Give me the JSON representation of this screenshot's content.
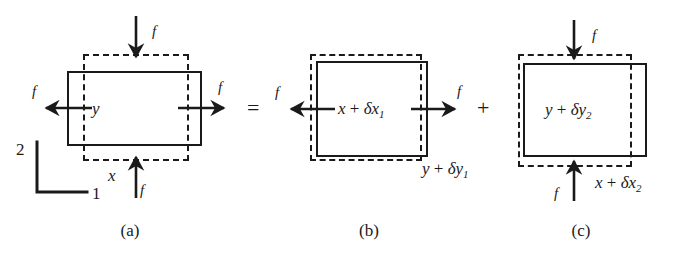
{
  "figure": {
    "type": "mechanics-decomposition-diagram",
    "ink_color": "#1a1a1a",
    "background": "#ffffff",
    "operators": {
      "equals": "=",
      "plus": "+"
    },
    "axis_indicator": {
      "vertical_label": "2",
      "horizontal_label": "1"
    },
    "panels": [
      {
        "id": "a",
        "caption": "(a)",
        "inner_labels": [
          {
            "name": "width-label",
            "text": "x"
          },
          {
            "name": "height-label",
            "text": "y"
          }
        ],
        "forces": [
          {
            "name": "force-top",
            "label": "f",
            "direction": "down"
          },
          {
            "name": "force-bottom",
            "label": "f",
            "direction": "up"
          },
          {
            "name": "force-left",
            "label": "f",
            "direction": "left"
          },
          {
            "name": "force-right",
            "label": "f",
            "direction": "right"
          }
        ],
        "shapes": [
          {
            "name": "solid-rectangle",
            "style": "solid"
          },
          {
            "name": "dashed-rectangle",
            "style": "dashed"
          }
        ]
      },
      {
        "id": "b",
        "caption": "(b)",
        "center_expr": {
          "base": "x",
          "op": "+",
          "delta": "δx",
          "sub": "1"
        },
        "bottom_expr": {
          "base": "y",
          "op": "+",
          "delta": "δy",
          "sub": "1"
        },
        "forces": [
          {
            "name": "force-left",
            "label": "f",
            "direction": "left"
          },
          {
            "name": "force-right",
            "label": "f",
            "direction": "right"
          }
        ],
        "shapes": [
          {
            "name": "solid-rectangle",
            "style": "solid"
          },
          {
            "name": "dashed-rectangle",
            "style": "dashed"
          }
        ]
      },
      {
        "id": "c",
        "caption": "(c)",
        "center_expr": {
          "base": "y",
          "op": "+",
          "delta": "δy",
          "sub": "2"
        },
        "bottom_expr": {
          "base": "x",
          "op": "+",
          "delta": "δx",
          "sub": "2"
        },
        "forces": [
          {
            "name": "force-top",
            "label": "f",
            "direction": "down"
          },
          {
            "name": "force-bottom",
            "label": "f",
            "direction": "up"
          }
        ],
        "shapes": [
          {
            "name": "solid-rectangle",
            "style": "solid"
          },
          {
            "name": "dashed-rectangle",
            "style": "dashed"
          }
        ]
      }
    ]
  }
}
